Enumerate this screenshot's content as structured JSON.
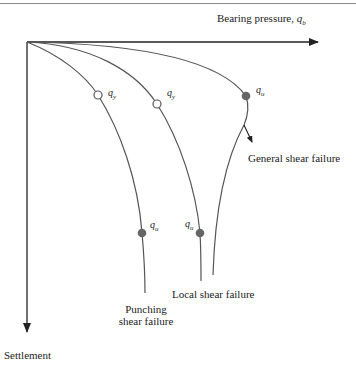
{
  "diagram": {
    "x_axis_label": "Bearing pressure, ",
    "x_axis_symbol": "q",
    "x_axis_sub": "b",
    "y_axis_label": "Settlement",
    "curves": [
      {
        "name": "Punching shear failure",
        "label_line1": "Punching",
        "label_line2": "shear failure",
        "markers": [
          {
            "type": "open",
            "symbol": "q",
            "sub": "y"
          },
          {
            "type": "filled",
            "symbol": "q",
            "sub": "u"
          }
        ]
      },
      {
        "name": "Local shear failure",
        "label": "Local shear failure",
        "markers": [
          {
            "type": "open",
            "symbol": "q",
            "sub": "y"
          },
          {
            "type": "filled",
            "symbol": "q",
            "sub": "u"
          }
        ]
      },
      {
        "name": "General shear failure",
        "label": "General shear failure",
        "markers": [
          {
            "type": "filled",
            "symbol": "q",
            "sub": "u"
          }
        ]
      }
    ],
    "colors": {
      "line": "#555555",
      "marker_fill": "#666666",
      "axis": "#222222"
    }
  }
}
